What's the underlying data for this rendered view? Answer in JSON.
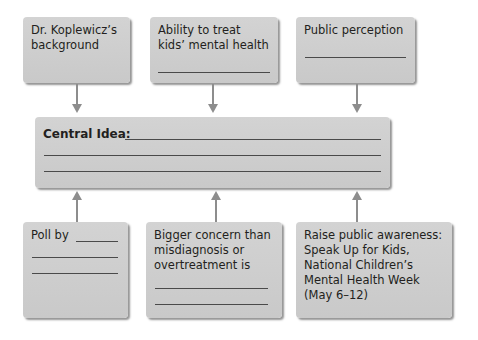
{
  "diagram": {
    "top_boxes": [
      {
        "label": "Dr. Koplewicz’s\nbackground"
      },
      {
        "label": "Ability to treat\nkids’ mental health"
      },
      {
        "label": "Public perception"
      }
    ],
    "central": {
      "label": "Central Idea:"
    },
    "bottom_boxes": [
      {
        "label": "Poll by"
      },
      {
        "label": "Bigger concern than\nmisdiagnosis or\novertreatment is"
      },
      {
        "label": "Raise public awareness:\nSpeak Up for Kids,\nNational Children’s\nMental Health Week\n(May 6–12)"
      }
    ],
    "colors": {
      "box_fill": "#cdcdcd",
      "arrow": "#8d8d8d",
      "text": "#231f20",
      "rule_line": "#4a4a4a"
    }
  }
}
